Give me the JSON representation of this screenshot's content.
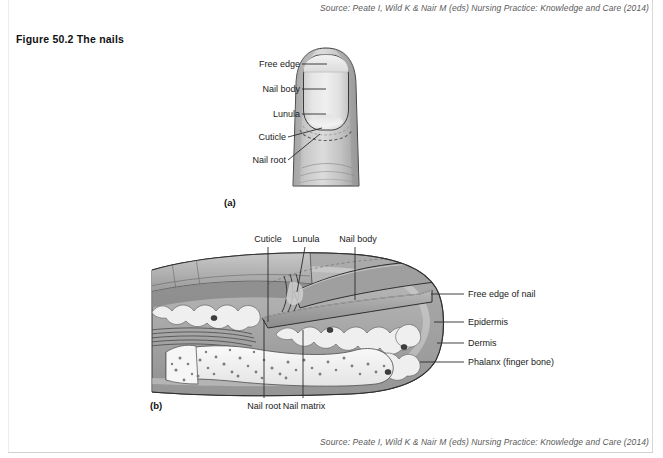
{
  "document": {
    "source_top": "Source: Peate I, Wild K & Nair M (eds) Nursing Practice: Knowledge and Care (2014)",
    "source_bottom": "Source: Peate I, Wild K & Nair M (eds) Nursing Practice: Knowledge and Care (2014)",
    "figure_title": "Figure 50.2   The nails"
  },
  "panel_a": {
    "caption": "(a)",
    "labels": {
      "free_edge": "Free edge",
      "nail_body": "Nail body",
      "lunula": "Lunula",
      "cuticle": "Cuticle",
      "nail_root": "Nail root"
    }
  },
  "panel_b": {
    "caption": "(b)",
    "labels": {
      "cuticle": "Cuticle",
      "lunula": "Lunula",
      "nail_body": "Nail body",
      "free_edge_of_nail": "Free edge of nail",
      "epidermis": "Epidermis",
      "dermis": "Dermis",
      "phalanx": "Phalanx (finger bone)",
      "nail_root": "Nail root",
      "nail_matrix": "Nail matrix"
    }
  },
  "colors": {
    "page_background": "#ffffff",
    "text": "#1a1a1a",
    "source_text": "#5a5a5a",
    "outline": "#2b2b2b",
    "skin_light": "#dcdcdc",
    "skin_mid": "#b4b4b4",
    "skin_dark": "#8d8d8d",
    "nail_light": "#e9e9e9",
    "tissue_light": "#efefef",
    "bone": "#f4f4f4",
    "nucleus": "#4a4a4a",
    "leader_line": "#2b2b2b"
  }
}
